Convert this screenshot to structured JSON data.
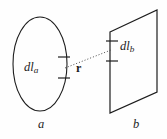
{
  "figure": {
    "background_color": "#fefefe",
    "stroke_color": "#1d1d1d",
    "dotted_color": "#4a4a4a",
    "labels": {
      "dl_a_main": "dl",
      "dl_a_sub": "a",
      "dl_b_main": "dl",
      "dl_b_sub": "b",
      "separation_vector": "r",
      "loop_a": "a",
      "loop_b": "b"
    },
    "shapes": {
      "loop_a": {
        "type": "ellipse",
        "center_x": 40,
        "center_y": 64,
        "radius_x": 27,
        "radius_y": 47
      },
      "loop_b": {
        "type": "parallelogram",
        "points": "110,32 157,10 157,92 110,113"
      },
      "element_a": {
        "type": "segment-ticks",
        "x": 64,
        "y_top": 57,
        "y_bottom": 78,
        "tick_half_width": 6
      },
      "element_b": {
        "type": "segment-ticks",
        "x": 112,
        "y_top": 41,
        "y_bottom": 61,
        "tick_half_width": 6
      },
      "separation_line": {
        "type": "dotted-line",
        "x1": 65,
        "y1": 68,
        "x2": 111,
        "y2": 50
      }
    }
  }
}
